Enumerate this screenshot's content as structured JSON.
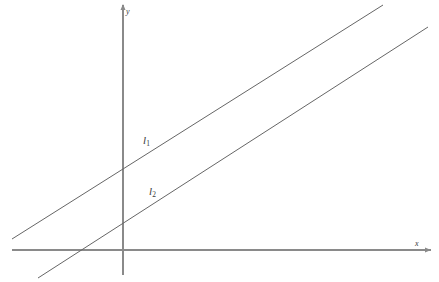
{
  "figure": {
    "type": "geometry-diagram",
    "background_color": "#ffffff",
    "stroke_color": "#666666",
    "axis_color": "#8a8a8a",
    "text_color": "#3a3a3a"
  },
  "axes": {
    "x_axis": {
      "label": "x",
      "arrow": "arrow-right",
      "x_start": 12,
      "x_end": 431,
      "y": 250
    },
    "y_axis": {
      "label": "y",
      "arrow": "arrow-up",
      "x": 123,
      "y_start": 5,
      "y_end": 275
    },
    "origin": {
      "x": 123,
      "y": 250
    }
  },
  "lines": [
    {
      "id": "l1",
      "label": "l",
      "subscript": "1",
      "x1": 12,
      "y1": 239,
      "x2": 383,
      "y2": 5,
      "y_intercept_px": 171,
      "label_x": 143,
      "label_y": 135
    },
    {
      "id": "l2",
      "label": "l",
      "subscript": "2",
      "x1": 38,
      "y1": 278,
      "x2": 428,
      "y2": 27,
      "y_intercept_px": 224,
      "x_intercept_px": 78,
      "label_x": 149,
      "label_y": 186
    }
  ],
  "chart_data": {
    "type": "line",
    "title": "",
    "xlabel": "x",
    "ylabel": "y",
    "grid": false,
    "legend": "inline-labels",
    "series": [
      {
        "name": "l1",
        "points": [
          [
            12,
            239
          ],
          [
            383,
            5
          ]
        ],
        "slope_screen": -0.631,
        "note": "upper line, crosses y-axis above origin"
      },
      {
        "name": "l2",
        "points": [
          [
            38,
            278
          ],
          [
            428,
            27
          ]
        ],
        "slope_screen": -0.644,
        "note": "lower line, parallel to l1, crosses x-axis left of origin"
      }
    ]
  }
}
